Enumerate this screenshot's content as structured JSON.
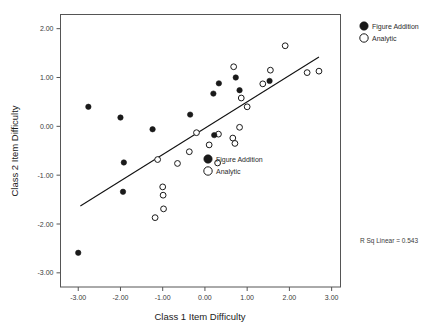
{
  "chart_data": {
    "type": "scatter",
    "title": "",
    "xlabel": "Class 1 Item Difficulty",
    "ylabel": "Class 2 Item Difficulty",
    "xlim": [
      -3.42,
      3.21
    ],
    "ylim": [
      -3.29,
      2.29
    ],
    "xticks": [
      "-3.00",
      "-2.00",
      "-1.00",
      "0.00",
      "1.00",
      "2.00",
      "3.00"
    ],
    "xtick_values": [
      -3,
      -2,
      -1,
      0,
      1,
      2,
      3
    ],
    "yticks": [
      "2.00",
      "1.00",
      "0.00",
      "-1.00",
      "-2.00",
      "-3.00"
    ],
    "ytick_values": [
      2,
      1,
      0,
      -1,
      -2,
      -3
    ],
    "grid": false,
    "legend_position": "outside-top-right",
    "annotations": [
      {
        "name": "r-squared",
        "text": "R Sq Linear = 0.543",
        "value": 0.543
      }
    ],
    "fit_line": {
      "label": "linear fit",
      "x_start": -2.95,
      "y_start": -1.63,
      "x_end": 2.7,
      "y_end": 1.42
    },
    "series": [
      {
        "name": "Figure Addition",
        "marker": "filled-circle",
        "color": "#1a1a1a",
        "points": [
          {
            "x": -3.0,
            "y": -2.59
          },
          {
            "x": -2.76,
            "y": 0.4
          },
          {
            "x": -2.0,
            "y": 0.18
          },
          {
            "x": -1.92,
            "y": -0.74
          },
          {
            "x": -1.94,
            "y": -1.34
          },
          {
            "x": -1.24,
            "y": -0.06
          },
          {
            "x": -0.35,
            "y": 0.24
          },
          {
            "x": 0.2,
            "y": 0.67
          },
          {
            "x": 0.33,
            "y": 0.88
          },
          {
            "x": 0.22,
            "y": -0.18
          },
          {
            "x": 0.73,
            "y": 1.0
          },
          {
            "x": 0.82,
            "y": 0.74
          },
          {
            "x": 1.53,
            "y": 0.93
          }
        ]
      },
      {
        "name": "Analytic",
        "marker": "open-circle",
        "color": "#1a1a1a",
        "points": [
          {
            "x": -1.12,
            "y": -0.68
          },
          {
            "x": -1.18,
            "y": -1.87
          },
          {
            "x": -1.0,
            "y": -1.24
          },
          {
            "x": -0.99,
            "y": -1.41
          },
          {
            "x": -0.98,
            "y": -1.69
          },
          {
            "x": -0.65,
            "y": -0.76
          },
          {
            "x": -0.37,
            "y": -0.52
          },
          {
            "x": -0.2,
            "y": -0.13
          },
          {
            "x": 0.1,
            "y": -0.38
          },
          {
            "x": 0.32,
            "y": -0.16
          },
          {
            "x": 0.3,
            "y": -0.75
          },
          {
            "x": 0.68,
            "y": 1.22
          },
          {
            "x": 0.66,
            "y": -0.24
          },
          {
            "x": 0.71,
            "y": -0.35
          },
          {
            "x": 0.82,
            "y": -0.02
          },
          {
            "x": 0.86,
            "y": 0.58
          },
          {
            "x": 1.0,
            "y": 0.4
          },
          {
            "x": 1.37,
            "y": 0.87
          },
          {
            "x": 1.55,
            "y": 1.15
          },
          {
            "x": 1.9,
            "y": 1.65
          },
          {
            "x": 2.42,
            "y": 1.1
          },
          {
            "x": 2.7,
            "y": 1.13
          }
        ]
      }
    ]
  },
  "legend_outer": {
    "items": [
      {
        "label": "Figure Addition",
        "marker": "filled-circle"
      },
      {
        "label": "Analytic",
        "marker": "open-circle"
      }
    ]
  },
  "legend_inner": {
    "items": [
      {
        "label": "Figure Addition",
        "marker": "filled-circle"
      },
      {
        "label": "Analytic",
        "marker": "open-circle"
      }
    ]
  }
}
